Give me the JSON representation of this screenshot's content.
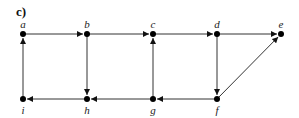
{
  "panel_label": "c)",
  "colors": {
    "edge": "#333333",
    "node": "#000000",
    "background": "#ffffff"
  },
  "nodes": [
    {
      "id": "a",
      "label": "a",
      "x": 23,
      "y": 34,
      "label_pos": "above"
    },
    {
      "id": "b",
      "label": "b",
      "x": 87,
      "y": 34,
      "label_pos": "above"
    },
    {
      "id": "c",
      "label": "c",
      "x": 153,
      "y": 34,
      "label_pos": "above"
    },
    {
      "id": "d",
      "label": "d",
      "x": 217,
      "y": 34,
      "label_pos": "above"
    },
    {
      "id": "e",
      "label": "e",
      "x": 281,
      "y": 34,
      "label_pos": "above"
    },
    {
      "id": "i",
      "label": "i",
      "x": 23,
      "y": 99,
      "label_pos": "below"
    },
    {
      "id": "h",
      "label": "h",
      "x": 87,
      "y": 99,
      "label_pos": "below"
    },
    {
      "id": "g",
      "label": "g",
      "x": 153,
      "y": 99,
      "label_pos": "below"
    },
    {
      "id": "f",
      "label": "f",
      "x": 217,
      "y": 99,
      "label_pos": "below"
    }
  ],
  "edges": [
    {
      "from": "a",
      "to": "b"
    },
    {
      "from": "b",
      "to": "c"
    },
    {
      "from": "c",
      "to": "d"
    },
    {
      "from": "d",
      "to": "e"
    },
    {
      "from": "i",
      "to": "a"
    },
    {
      "from": "b",
      "to": "h"
    },
    {
      "from": "g",
      "to": "c"
    },
    {
      "from": "d",
      "to": "f"
    },
    {
      "from": "f",
      "to": "e"
    },
    {
      "from": "h",
      "to": "i"
    },
    {
      "from": "g",
      "to": "h"
    },
    {
      "from": "f",
      "to": "g"
    }
  ]
}
